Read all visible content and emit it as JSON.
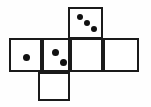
{
  "figure": {
    "shape": "cross-net",
    "background_color": "#fefefe",
    "line_color": "#1a1a1a",
    "pip_color": "#111111",
    "faces": [
      {
        "id": "face-top",
        "name": "top-face-three-pips",
        "pip_count": 3,
        "pip_arrangement": "diagonal",
        "x": 68,
        "y": 7,
        "w": 35,
        "h": 32,
        "pips": [
          {
            "cx": 10,
            "cy": 8,
            "r": 3
          },
          {
            "cx": 17,
            "cy": 14,
            "r": 3
          },
          {
            "cx": 24,
            "cy": 20,
            "r": 3
          }
        ]
      },
      {
        "id": "face-left",
        "name": "left-face-one-pip",
        "pip_count": 1,
        "pip_arrangement": "center",
        "x": 9,
        "y": 38,
        "w": 33,
        "h": 34,
        "pips": [
          {
            "cx": 15,
            "cy": 17,
            "r": 3.5
          }
        ]
      },
      {
        "id": "face-second",
        "name": "second-face-two-pips",
        "pip_count": 2,
        "pip_arrangement": "diagonal",
        "x": 42,
        "y": 38,
        "w": 28,
        "h": 34,
        "pips": [
          {
            "cx": 11,
            "cy": 12,
            "r": 3.5
          },
          {
            "cx": 19,
            "cy": 22,
            "r": 3.5
          }
        ]
      },
      {
        "id": "face-third",
        "name": "third-face-blank",
        "pip_count": 0,
        "pip_arrangement": "none",
        "x": 70,
        "y": 38,
        "w": 33,
        "h": 34,
        "pips": []
      },
      {
        "id": "face-right",
        "name": "right-face-blank",
        "pip_count": 0,
        "pip_arrangement": "none",
        "x": 103,
        "y": 38,
        "w": 36,
        "h": 34,
        "pips": []
      },
      {
        "id": "face-bottom",
        "name": "bottom-face-blank",
        "pip_count": 0,
        "pip_arrangement": "none",
        "x": 38,
        "y": 72,
        "w": 32,
        "h": 29,
        "pips": []
      }
    ]
  }
}
